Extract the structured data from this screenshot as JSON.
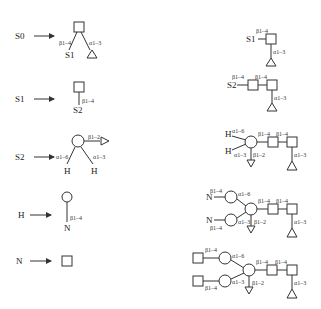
{
  "rules": [
    {
      "lhs": "S0"
    },
    {
      "lhs": "S1"
    },
    {
      "lhs": "S2"
    },
    {
      "lhs": "H"
    },
    {
      "lhs": "N"
    }
  ],
  "labels": {
    "S0": "S0",
    "S1": "S1",
    "S2": "S2",
    "H": "H",
    "N": "N",
    "b14": "β1–4",
    "a13": "α1–3",
    "a16": "α1–6",
    "b12": "β1–2"
  }
}
